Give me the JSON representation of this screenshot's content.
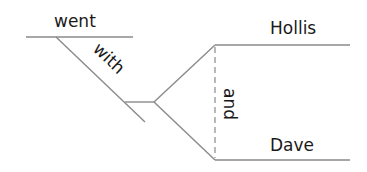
{
  "diagram": {
    "type": "sentence-diagram",
    "words": {
      "verb": "went",
      "preposition": "with",
      "object_1": "Hollis",
      "object_2": "Dave",
      "conjunction": "and"
    },
    "colors": {
      "line": "#8a8a8a",
      "text": "#1a1a1a",
      "background": "#ffffff"
    }
  }
}
